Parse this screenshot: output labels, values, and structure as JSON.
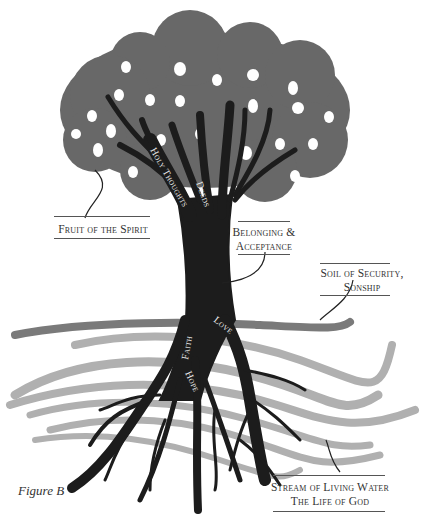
{
  "figure": {
    "caption": "Figure B"
  },
  "colors": {
    "canopy": "#686868",
    "fruit": "#ffffff",
    "trunk": "#1c1c1c",
    "soil_band": "#7a7a7a",
    "stream": "#b0b0b0",
    "label_text": "#333333",
    "trunk_text": "#eeeeee"
  },
  "trunk_labels": {
    "holy_thoughts": "Holy Thoughts",
    "deeds": "Deeds",
    "faith": "Faith",
    "love": "Love",
    "hope": "Hope"
  },
  "callouts": {
    "fruit": {
      "line1": "Fruit of the Spirit"
    },
    "belonging": {
      "line1": "Belonging &",
      "line2": "Acceptance"
    },
    "soil": {
      "line1": "Soil of Security,",
      "line2": "Sonship"
    },
    "stream": {
      "line1": "Stream of Living Water",
      "line2": "The Life of God"
    }
  }
}
